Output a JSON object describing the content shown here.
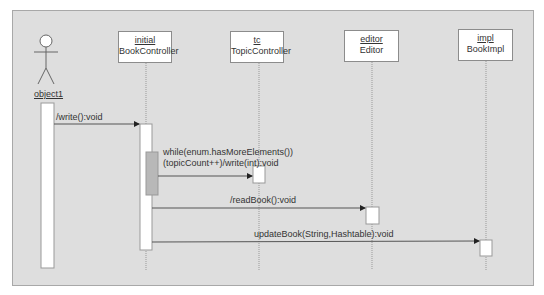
{
  "diagram": {
    "type": "sequence",
    "actor": {
      "name": "object1"
    },
    "lifelines": [
      {
        "instance": "initial",
        "class": "BookController"
      },
      {
        "instance": "tc",
        "class": "TopicController"
      },
      {
        "instance": "editor",
        "class": "Editor"
      },
      {
        "instance": "impl",
        "class": "BookImpl"
      }
    ],
    "messages": [
      {
        "label": "/write():void",
        "from": "object1",
        "to": "initial"
      },
      {
        "label_line1": "while(enum.hasMoreElements())",
        "label_line2": "(topicCount++)/write(int):void",
        "from": "initial",
        "to": "tc"
      },
      {
        "label": "/readBook():void",
        "from": "initial",
        "to": "editor"
      },
      {
        "label": "updateBook(String,Hashtable):void",
        "from": "initial",
        "to": "impl"
      }
    ],
    "colors": {
      "background": "#dedede",
      "box": "#ffffff",
      "loop_activation": "#b8b8b8",
      "line": "#555555"
    }
  }
}
